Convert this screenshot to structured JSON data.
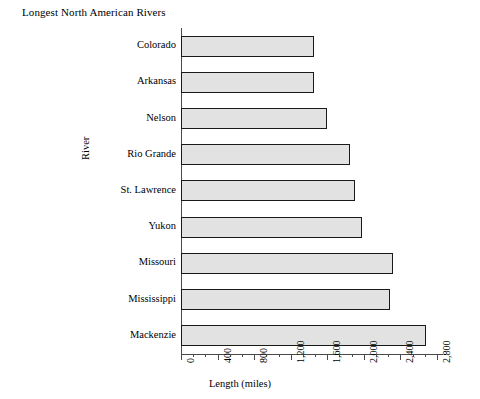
{
  "chart_data": {
    "type": "bar",
    "orientation": "horizontal",
    "title": "Longest North American Rivers",
    "xlabel": "Length (miles)",
    "ylabel": "River",
    "categories": [
      "Colorado",
      "Arkansas",
      "Nelson",
      "Rio Grande",
      "St. Lawrence",
      "Yukon",
      "Missouri",
      "Mississippi",
      "Mackenzie"
    ],
    "values": [
      1450,
      1450,
      1600,
      1850,
      1900,
      1980,
      2315,
      2290,
      2680
    ],
    "xlim": [
      0,
      2800
    ],
    "xticks": [
      0,
      400,
      800,
      1200,
      1600,
      2000,
      2400,
      2800
    ],
    "xtick_labels": [
      "0",
      "400",
      "800",
      "1,200",
      "1,600",
      "2,000",
      "2,400",
      "2,800"
    ],
    "minor_ticks_per_interval": 2,
    "grid": false,
    "legend": null,
    "bar_fill_color": "#e2e2e2",
    "bar_edge_color": "#1a1a1a",
    "bar_pattern": "dotted-stipple",
    "background_color": "#ffffff",
    "axis_color": "#4a4a4a"
  }
}
